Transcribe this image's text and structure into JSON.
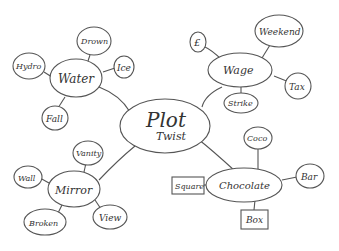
{
  "diagram": {
    "type": "mind-map",
    "style": "hand-drawn",
    "colors": {
      "ink": "#555555",
      "text": "#333333",
      "background": "#ffffff"
    },
    "center": {
      "id": "center",
      "label_line1": "Plot",
      "label_line2": "Twist"
    },
    "branches": [
      {
        "id": "water",
        "label": "Water",
        "children": [
          {
            "id": "hydro",
            "label": "Hydro",
            "shape": "ellipse"
          },
          {
            "id": "drown",
            "label": "Drown",
            "shape": "ellipse"
          },
          {
            "id": "ice",
            "label": "Ice",
            "shape": "ellipse"
          },
          {
            "id": "fall",
            "label": "Fall",
            "shape": "ellipse"
          }
        ]
      },
      {
        "id": "wage",
        "label": "Wage",
        "children": [
          {
            "id": "pound",
            "label": "£",
            "shape": "ellipse"
          },
          {
            "id": "weekend",
            "label": "Weekend",
            "shape": "ellipse"
          },
          {
            "id": "tax",
            "label": "Tax",
            "shape": "ellipse"
          },
          {
            "id": "strike",
            "label": "Strike",
            "shape": "ellipse"
          }
        ]
      },
      {
        "id": "mirror",
        "label": "Mirror",
        "children": [
          {
            "id": "vanity",
            "label": "Vanity",
            "shape": "ellipse"
          },
          {
            "id": "wall",
            "label": "Wall",
            "shape": "ellipse"
          },
          {
            "id": "broken",
            "label": "Broken",
            "shape": "ellipse"
          },
          {
            "id": "view",
            "label": "View",
            "shape": "ellipse"
          }
        ]
      },
      {
        "id": "chocolate",
        "label": "Chocolate",
        "children": [
          {
            "id": "coco",
            "label": "Coco",
            "shape": "ellipse"
          },
          {
            "id": "bar",
            "label": "Bar",
            "shape": "ellipse"
          },
          {
            "id": "square",
            "label": "Square",
            "shape": "rect"
          },
          {
            "id": "box",
            "label": "Box",
            "shape": "rect"
          }
        ]
      }
    ]
  }
}
